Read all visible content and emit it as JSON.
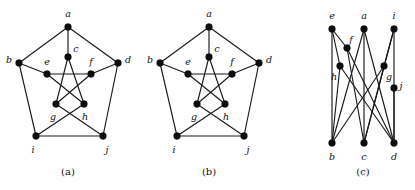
{
  "figure": {
    "background_color": "#ffffff",
    "edge_color": "#1a1a1a",
    "vertex_color": "#0d0d0d",
    "label_color": "#111111",
    "width": 415,
    "height": 190
  },
  "panels": [
    {
      "id": "a",
      "caption": "(a)",
      "caption_pos": {
        "x": 68,
        "y": 172
      },
      "layout": "pentagon-pentagram",
      "vertices": [
        {
          "id": "a",
          "label": "a",
          "x": 68,
          "y": 27,
          "r": 3.4,
          "label_x": 68,
          "label_y": 14
        },
        {
          "id": "b",
          "label": "b",
          "x": 19,
          "y": 63,
          "r": 3.4,
          "label_x": 9,
          "label_y": 60
        },
        {
          "id": "d",
          "label": "d",
          "x": 118,
          "y": 63,
          "r": 3.4,
          "label_x": 128,
          "label_y": 60
        },
        {
          "id": "i",
          "label": "i",
          "x": 36,
          "y": 136,
          "r": 3.4,
          "label_x": 33,
          "label_y": 150
        },
        {
          "id": "j",
          "label": "j",
          "x": 103,
          "y": 136,
          "r": 3.4,
          "label_x": 107,
          "label_y": 150
        },
        {
          "id": "c",
          "label": "c",
          "x": 68,
          "y": 57,
          "r": 3.4,
          "label_x": 76,
          "label_y": 49
        },
        {
          "id": "e",
          "label": "e",
          "x": 47,
          "y": 74,
          "r": 3.4,
          "label_x": 47,
          "label_y": 62
        },
        {
          "id": "f",
          "label": "f",
          "x": 91,
          "y": 74,
          "r": 3.4,
          "label_x": 91,
          "label_y": 62
        },
        {
          "id": "g",
          "label": "g",
          "x": 56,
          "y": 104,
          "r": 3.4,
          "label_x": 53,
          "label_y": 117
        },
        {
          "id": "h",
          "label": "h",
          "x": 84,
          "y": 104,
          "r": 3.4,
          "label_x": 85,
          "label_y": 117
        }
      ],
      "edges": [
        [
          "a",
          "b"
        ],
        [
          "a",
          "d"
        ],
        [
          "b",
          "i"
        ],
        [
          "d",
          "j"
        ],
        [
          "i",
          "j"
        ],
        [
          "a",
          "c"
        ],
        [
          "b",
          "e"
        ],
        [
          "d",
          "f"
        ],
        [
          "i",
          "h"
        ],
        [
          "j",
          "g"
        ],
        [
          "c",
          "g"
        ],
        [
          "c",
          "h"
        ],
        [
          "e",
          "f"
        ],
        [
          "e",
          "h"
        ],
        [
          "f",
          "g"
        ]
      ]
    },
    {
      "id": "b",
      "caption": "(b)",
      "caption_pos": {
        "x": 209,
        "y": 172
      },
      "layout": "pentagon-pentagram",
      "vertices": [
        {
          "id": "a",
          "label": "a",
          "x": 209,
          "y": 27,
          "r": 3.4,
          "label_x": 209,
          "label_y": 14
        },
        {
          "id": "b",
          "label": "b",
          "x": 160,
          "y": 63,
          "r": 3.4,
          "label_x": 150,
          "label_y": 60
        },
        {
          "id": "d",
          "label": "d",
          "x": 259,
          "y": 63,
          "r": 3.4,
          "label_x": 269,
          "label_y": 60
        },
        {
          "id": "i",
          "label": "i",
          "x": 177,
          "y": 136,
          "r": 3.4,
          "label_x": 174,
          "label_y": 150
        },
        {
          "id": "j",
          "label": "j",
          "x": 244,
          "y": 136,
          "r": 3.4,
          "label_x": 248,
          "label_y": 150
        },
        {
          "id": "c",
          "label": "c",
          "x": 209,
          "y": 57,
          "r": 3.4,
          "label_x": 217,
          "label_y": 49
        },
        {
          "id": "e",
          "label": "e",
          "x": 188,
          "y": 74,
          "r": 3.4,
          "label_x": 188,
          "label_y": 62
        },
        {
          "id": "f",
          "label": "f",
          "x": 232,
          "y": 74,
          "r": 3.4,
          "label_x": 232,
          "label_y": 62
        },
        {
          "id": "g",
          "label": "g",
          "x": 197,
          "y": 104,
          "r": 3.4,
          "label_x": 194,
          "label_y": 117
        },
        {
          "id": "h",
          "label": "h",
          "x": 225,
          "y": 104,
          "r": 3.4,
          "label_x": 226,
          "label_y": 117
        }
      ],
      "edges": [
        [
          "a",
          "b"
        ],
        [
          "a",
          "d"
        ],
        [
          "b",
          "i"
        ],
        [
          "d",
          "j"
        ],
        [
          "i",
          "j"
        ],
        [
          "a",
          "c"
        ],
        [
          "b",
          "e"
        ],
        [
          "d",
          "f"
        ],
        [
          "i",
          "h"
        ],
        [
          "j",
          "g"
        ],
        [
          "c",
          "g"
        ],
        [
          "c",
          "h"
        ],
        [
          "e",
          "f"
        ],
        [
          "e",
          "h"
        ],
        [
          "f",
          "g"
        ]
      ]
    },
    {
      "id": "c",
      "caption": "(c)",
      "caption_pos": {
        "x": 363,
        "y": 172
      },
      "layout": "bipartite-columns",
      "vertices": [
        {
          "id": "e",
          "label": "e",
          "x": 332,
          "y": 29,
          "r": 3.4,
          "label_x": 332,
          "label_y": 16
        },
        {
          "id": "a",
          "label": "a",
          "x": 364,
          "y": 29,
          "r": 3.4,
          "label_x": 364,
          "label_y": 16
        },
        {
          "id": "i",
          "label": "i",
          "x": 394,
          "y": 29,
          "r": 3.4,
          "label_x": 394,
          "label_y": 16
        },
        {
          "id": "f",
          "label": "f",
          "x": 347,
          "y": 48,
          "r": 3.4,
          "label_x": 351,
          "label_y": 40
        },
        {
          "id": "h",
          "label": "h",
          "x": 340,
          "y": 66,
          "r": 3.4,
          "label_x": 334,
          "label_y": 77
        },
        {
          "id": "g",
          "label": "g",
          "x": 384,
          "y": 66,
          "r": 3.4,
          "label_x": 389,
          "label_y": 77
        },
        {
          "id": "j",
          "label": "j",
          "x": 394,
          "y": 88,
          "r": 3.4,
          "label_x": 401,
          "label_y": 86
        },
        {
          "id": "b",
          "label": "b",
          "x": 332,
          "y": 143,
          "r": 3.4,
          "label_x": 332,
          "label_y": 157
        },
        {
          "id": "c",
          "label": "c",
          "x": 364,
          "y": 143,
          "r": 3.4,
          "label_x": 364,
          "label_y": 157
        },
        {
          "id": "d",
          "label": "d",
          "x": 394,
          "y": 143,
          "r": 3.4,
          "label_x": 394,
          "label_y": 157
        }
      ],
      "edges": [
        [
          "e",
          "b"
        ],
        [
          "e",
          "f"
        ],
        [
          "e",
          "h"
        ],
        [
          "a",
          "b"
        ],
        [
          "a",
          "c"
        ],
        [
          "a",
          "d"
        ],
        [
          "i",
          "g"
        ],
        [
          "i",
          "d"
        ],
        [
          "i",
          "c"
        ],
        [
          "f",
          "c"
        ],
        [
          "f",
          "d"
        ],
        [
          "h",
          "b"
        ],
        [
          "h",
          "d"
        ],
        [
          "g",
          "b"
        ],
        [
          "g",
          "c"
        ],
        [
          "j",
          "d"
        ]
      ]
    }
  ]
}
